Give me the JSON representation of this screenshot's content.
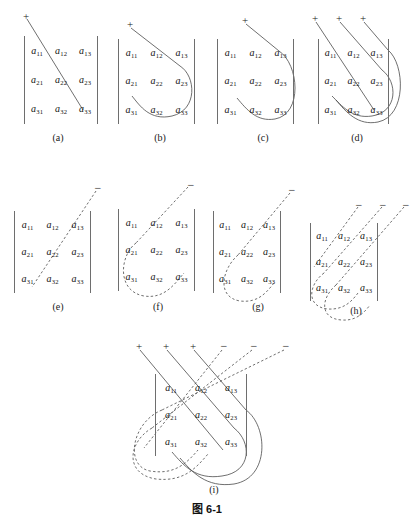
{
  "figure": {
    "caption": "图 6-1",
    "caption_top": 500,
    "background": "#ffffff",
    "ink_color": "#4a4a4a",
    "bar_color": "#6e6e6e",
    "text_color": "#121212"
  },
  "matrix": {
    "rows": [
      [
        {
          "base": "a",
          "sub": "11"
        },
        {
          "base": "a",
          "sub": "12"
        },
        {
          "base": "a",
          "sub": "13"
        }
      ],
      [
        {
          "base": "a",
          "sub": "21"
        },
        {
          "base": "a",
          "sub": "22"
        },
        {
          "base": "a",
          "sub": "23"
        }
      ],
      [
        {
          "base": "a",
          "sub": "31"
        },
        {
          "base": "a",
          "sub": "32"
        },
        {
          "base": "a",
          "sub": "33"
        }
      ]
    ]
  },
  "signs": {
    "plus": "+",
    "minus": "−"
  },
  "panels": [
    {
      "id": "a",
      "label": "(a)",
      "sign_type": "plus",
      "description": "main diagonal a11-a22-a33, solid, plus"
    },
    {
      "id": "b",
      "label": "(b)",
      "sign_type": "plus",
      "description": "a12-a23 then wrap to a31, solid, plus"
    },
    {
      "id": "c",
      "label": "(c)",
      "sign_type": "plus",
      "description": "a13 then wrap to a21-a32, solid, plus"
    },
    {
      "id": "d",
      "label": "(d)",
      "sign_type": "plus",
      "description": "superposition of a, b, c with three plus signs"
    },
    {
      "id": "e",
      "label": "(e)",
      "sign_type": "minus",
      "description": "anti-diagonal a13-a22-a31, dashed, minus"
    },
    {
      "id": "f",
      "label": "(f)",
      "sign_type": "minus",
      "description": "a12-a21 then wrap to a33, dashed, minus"
    },
    {
      "id": "g",
      "label": "(g)",
      "sign_type": "minus",
      "description": "a11 then wrap to a23-a32, dashed, minus"
    },
    {
      "id": "h",
      "label": "(h)",
      "sign_type": "minus",
      "description": "superposition of e, f, g with three minus signs"
    },
    {
      "id": "i",
      "label": "(i)",
      "sign_type": "both",
      "description": "full Sarrus rule: three plus solid diagonals and three minus dashed diagonals"
    }
  ]
}
